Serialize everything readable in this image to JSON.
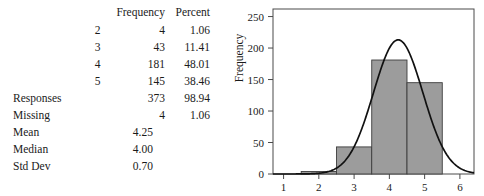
{
  "table": {
    "headers": [
      "",
      "",
      "Frequency",
      "Percent"
    ],
    "header_frequency": "Frequency",
    "header_percent": "Percent",
    "rows": [
      {
        "label": "",
        "category": "2",
        "frequency": "4",
        "percent": "1.06"
      },
      {
        "label": "",
        "category": "3",
        "frequency": "43",
        "percent": "11.41"
      },
      {
        "label": "",
        "category": "4",
        "frequency": "181",
        "percent": "48.01"
      },
      {
        "label": "",
        "category": "5",
        "frequency": "145",
        "percent": "38.46"
      },
      {
        "label": "Responses",
        "category": "",
        "frequency": "373",
        "percent": "98.94"
      },
      {
        "label": "Missing",
        "category": "",
        "frequency": "4",
        "percent": "1.06"
      }
    ],
    "stats": [
      {
        "label": "Mean",
        "value": "4.25"
      },
      {
        "label": "Median",
        "value": "4.00"
      },
      {
        "label": "Std Dev",
        "value": "0.70"
      }
    ]
  },
  "chart_data": {
    "type": "bar",
    "title": "",
    "xlabel": "",
    "ylabel": "Frequency",
    "categories": [
      "2",
      "3",
      "4",
      "5"
    ],
    "values": [
      4,
      43,
      181,
      145
    ],
    "bar_width": 1,
    "x": [
      2,
      3,
      4,
      5
    ],
    "xlim": [
      0.7,
      6.4
    ],
    "ylim": [
      0,
      262
    ],
    "xticks": [
      1,
      2,
      3,
      4,
      5,
      6
    ],
    "xticklabels": [
      "1",
      "2",
      "3",
      "4",
      "5",
      "6"
    ],
    "yticks": [
      0,
      50,
      100,
      150,
      200,
      250
    ],
    "yticklabels": [
      "0",
      "50",
      "100",
      "150",
      "200",
      "250"
    ],
    "grid": false,
    "legend": false,
    "bar_color": "#9c9c9c",
    "bar_edge_color": "#3d3d3d",
    "curve_color": "#111111",
    "overlay": {
      "type": "normal-curve",
      "mean": 4.25,
      "std_dev": 0.7,
      "peak_value": 213
    }
  }
}
